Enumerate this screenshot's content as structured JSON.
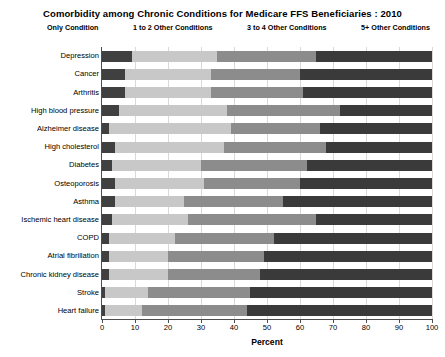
{
  "chart_data": {
    "type": "bar",
    "orientation": "horizontal",
    "stacked": true,
    "stack_mode": "percent",
    "title": "Comorbidity among Chronic Conditions for Medicare FFS Beneficiaries : 2010",
    "xlabel": "Percent",
    "ylabel": "",
    "xlim": [
      0,
      100
    ],
    "xticks": [
      0,
      10,
      20,
      30,
      40,
      50,
      60,
      70,
      80,
      90,
      100
    ],
    "grid": true,
    "legend_position": "top",
    "categories": [
      "Depression",
      "Cancer",
      "Arthritis",
      "High blood pressure",
      "Alzheimer disease",
      "High cholesterol",
      "Diabetes",
      "Osteoporosis",
      "Asthma",
      "Ischemic heart disease",
      "COPD",
      "Atrial fibrillation",
      "Chronic kidney disease",
      "Stroke",
      "Heart failure"
    ],
    "series": [
      {
        "name": "Only Condition",
        "color": "#404040",
        "values": [
          9,
          7,
          7,
          5,
          2,
          4,
          3,
          4,
          4,
          3,
          2,
          2,
          2,
          1,
          1
        ]
      },
      {
        "name": "1 to 2 Other Conditions",
        "color": "#c8c8c8",
        "values": [
          26,
          26,
          26,
          33,
          37,
          33,
          27,
          27,
          21,
          23,
          20,
          18,
          18,
          13,
          11
        ]
      },
      {
        "name": "3 to 4 Other Conditions",
        "color": "#8c8c8c",
        "values": [
          30,
          27,
          28,
          34,
          27,
          31,
          32,
          29,
          30,
          39,
          30,
          29,
          28,
          31,
          32
        ]
      },
      {
        "name": "5+ Other Conditions",
        "color": "#3a3a3a",
        "values": [
          35,
          40,
          39,
          28,
          34,
          32,
          38,
          40,
          45,
          35,
          48,
          51,
          52,
          55,
          56
        ]
      }
    ],
    "cumulative_boundaries": [
      [
        9,
        35,
        65
      ],
      [
        7,
        33,
        60
      ],
      [
        7,
        33,
        61
      ],
      [
        5,
        38,
        72
      ],
      [
        2,
        39,
        66
      ],
      [
        4,
        37,
        68
      ],
      [
        3,
        30,
        62
      ],
      [
        4,
        31,
        60
      ],
      [
        4,
        25,
        55
      ],
      [
        3,
        26,
        65
      ],
      [
        2,
        22,
        52
      ],
      [
        2,
        20,
        49
      ],
      [
        2,
        20,
        48
      ],
      [
        1,
        14,
        45
      ],
      [
        1,
        12,
        44
      ]
    ]
  }
}
